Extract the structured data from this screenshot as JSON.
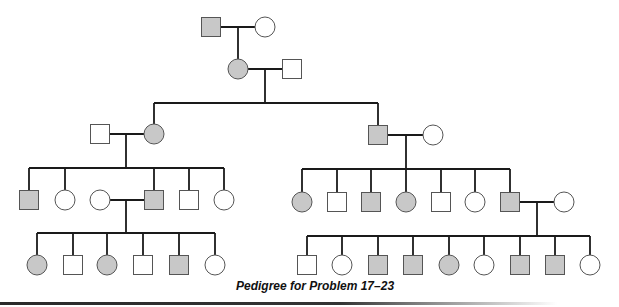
{
  "caption": "Pedigree for Problem 17–23",
  "colors": {
    "line": "#1a1a1a",
    "affected_fill": "#c8c8c8",
    "unaffected_fill": "#ffffff",
    "outline": "#555555"
  },
  "legend": {
    "square": "male",
    "circle": "female",
    "shaded": "affected",
    "unshaded": "unaffected"
  },
  "generations": [
    {
      "label": "I",
      "individuals": [
        {
          "id": "I-1",
          "sex": "male",
          "affected": true,
          "x": 211,
          "y": 27
        },
        {
          "id": "I-2",
          "sex": "female",
          "affected": false,
          "x": 265,
          "y": 27
        }
      ]
    },
    {
      "label": "II (top)",
      "individuals": [
        {
          "id": "II-1",
          "sex": "female",
          "affected": true,
          "x": 238,
          "y": 69,
          "parents": [
            "I-1",
            "I-2"
          ]
        },
        {
          "id": "II-2",
          "sex": "male",
          "affected": false,
          "x": 292,
          "y": 69
        }
      ]
    },
    {
      "label": "III (children of II-1 x II-2)",
      "individuals": [
        {
          "id": "III-1",
          "sex": "male",
          "affected": false,
          "x": 100,
          "y": 134
        },
        {
          "id": "III-2",
          "sex": "female",
          "affected": true,
          "x": 154,
          "y": 134,
          "parents": [
            "II-1",
            "II-2"
          ]
        },
        {
          "id": "III-3",
          "sex": "male",
          "affected": true,
          "x": 378,
          "y": 135,
          "parents": [
            "II-1",
            "II-2"
          ]
        },
        {
          "id": "III-4",
          "sex": "female",
          "affected": false,
          "x": 433,
          "y": 135
        }
      ]
    },
    {
      "label": "IV",
      "individuals": [
        {
          "id": "IV-1",
          "sex": "male",
          "affected": true,
          "x": 29,
          "y": 200,
          "parents": [
            "III-1",
            "III-2"
          ]
        },
        {
          "id": "IV-2",
          "sex": "female",
          "affected": false,
          "x": 65,
          "y": 200,
          "parents": [
            "III-1",
            "III-2"
          ]
        },
        {
          "id": "IV-3",
          "sex": "female",
          "affected": false,
          "x": 100,
          "y": 200
        },
        {
          "id": "IV-4",
          "sex": "male",
          "affected": true,
          "x": 154,
          "y": 200,
          "parents": [
            "III-1",
            "III-2"
          ]
        },
        {
          "id": "IV-5",
          "sex": "male",
          "affected": false,
          "x": 189,
          "y": 200,
          "parents": [
            "III-1",
            "III-2"
          ]
        },
        {
          "id": "IV-6",
          "sex": "female",
          "affected": false,
          "x": 224,
          "y": 200,
          "parents": [
            "III-1",
            "III-2"
          ]
        },
        {
          "id": "IV-7",
          "sex": "female",
          "affected": true,
          "x": 302,
          "y": 202,
          "parents": [
            "III-3",
            "III-4"
          ]
        },
        {
          "id": "IV-8",
          "sex": "male",
          "affected": false,
          "x": 337,
          "y": 202,
          "parents": [
            "III-3",
            "III-4"
          ]
        },
        {
          "id": "IV-9",
          "sex": "male",
          "affected": true,
          "x": 371,
          "y": 202,
          "parents": [
            "III-3",
            "III-4"
          ]
        },
        {
          "id": "IV-10",
          "sex": "female",
          "affected": true,
          "x": 406,
          "y": 202,
          "parents": [
            "III-3",
            "III-4"
          ]
        },
        {
          "id": "IV-11",
          "sex": "male",
          "affected": false,
          "x": 441,
          "y": 202,
          "parents": [
            "III-3",
            "III-4"
          ]
        },
        {
          "id": "IV-12",
          "sex": "female",
          "affected": false,
          "x": 475,
          "y": 202,
          "parents": [
            "III-3",
            "III-4"
          ]
        },
        {
          "id": "IV-13",
          "sex": "male",
          "affected": true,
          "x": 510,
          "y": 202,
          "parents": [
            "III-3",
            "III-4"
          ]
        },
        {
          "id": "IV-14",
          "sex": "female",
          "affected": false,
          "x": 564,
          "y": 202
        }
      ]
    },
    {
      "label": "V",
      "individuals": [
        {
          "id": "V-1",
          "sex": "female",
          "affected": true,
          "x": 37,
          "y": 265,
          "parents": [
            "IV-3",
            "IV-4"
          ]
        },
        {
          "id": "V-2",
          "sex": "male",
          "affected": false,
          "x": 73,
          "y": 265,
          "parents": [
            "IV-3",
            "IV-4"
          ]
        },
        {
          "id": "V-3",
          "sex": "female",
          "affected": true,
          "x": 107,
          "y": 265,
          "parents": [
            "IV-3",
            "IV-4"
          ]
        },
        {
          "id": "V-4",
          "sex": "male",
          "affected": false,
          "x": 143,
          "y": 265,
          "parents": [
            "IV-3",
            "IV-4"
          ]
        },
        {
          "id": "V-5",
          "sex": "male",
          "affected": true,
          "x": 179,
          "y": 265,
          "parents": [
            "IV-3",
            "IV-4"
          ]
        },
        {
          "id": "V-6",
          "sex": "female",
          "affected": false,
          "x": 215,
          "y": 265,
          "parents": [
            "IV-3",
            "IV-4"
          ]
        },
        {
          "id": "V-7",
          "sex": "male",
          "affected": false,
          "x": 307,
          "y": 265,
          "parents": [
            "IV-13",
            "IV-14"
          ]
        },
        {
          "id": "V-8",
          "sex": "female",
          "affected": false,
          "x": 342,
          "y": 265,
          "parents": [
            "IV-13",
            "IV-14"
          ]
        },
        {
          "id": "V-9",
          "sex": "male",
          "affected": true,
          "x": 378,
          "y": 265,
          "parents": [
            "IV-13",
            "IV-14"
          ]
        },
        {
          "id": "V-10",
          "sex": "male",
          "affected": true,
          "x": 413,
          "y": 265,
          "parents": [
            "IV-13",
            "IV-14"
          ]
        },
        {
          "id": "V-11",
          "sex": "female",
          "affected": true,
          "x": 449,
          "y": 265,
          "parents": [
            "IV-13",
            "IV-14"
          ]
        },
        {
          "id": "V-12",
          "sex": "female",
          "affected": false,
          "x": 484,
          "y": 265,
          "parents": [
            "IV-13",
            "IV-14"
          ]
        },
        {
          "id": "V-13",
          "sex": "male",
          "affected": true,
          "x": 520,
          "y": 265,
          "parents": [
            "IV-13",
            "IV-14"
          ]
        },
        {
          "id": "V-14",
          "sex": "male",
          "affected": true,
          "x": 555,
          "y": 265,
          "parents": [
            "IV-13",
            "IV-14"
          ]
        },
        {
          "id": "V-15",
          "sex": "female",
          "affected": false,
          "x": 590,
          "y": 265,
          "parents": [
            "IV-13",
            "IV-14"
          ]
        }
      ]
    }
  ],
  "matings": [
    {
      "a": "I-1",
      "b": "I-2",
      "y": 27,
      "drop_x": 238,
      "bar_y": 0,
      "children": [
        "II-1"
      ]
    },
    {
      "a": "II-1",
      "b": "II-2",
      "y": 69,
      "drop_x": 265,
      "bar_y": 103,
      "children": [
        "III-2",
        "III-3"
      ]
    },
    {
      "a": "III-1",
      "b": "III-2",
      "y": 134,
      "drop_x": 126,
      "bar_y": 168,
      "children": [
        "IV-1",
        "IV-2",
        "IV-4",
        "IV-5",
        "IV-6"
      ]
    },
    {
      "a": "III-3",
      "b": "III-4",
      "y": 135,
      "drop_x": 406,
      "bar_y": 169,
      "children": [
        "IV-7",
        "IV-8",
        "IV-9",
        "IV-10",
        "IV-11",
        "IV-12",
        "IV-13"
      ]
    },
    {
      "a": "IV-3",
      "b": "IV-4",
      "y": 200,
      "drop_x": 126,
      "bar_y": 233,
      "children": [
        "V-1",
        "V-2",
        "V-3",
        "V-4",
        "V-5",
        "V-6"
      ]
    },
    {
      "a": "IV-13",
      "b": "IV-14",
      "y": 202,
      "drop_x": 537,
      "bar_y": 236,
      "children": [
        "V-7",
        "V-8",
        "V-9",
        "V-10",
        "V-11",
        "V-12",
        "V-13",
        "V-14",
        "V-15"
      ]
    }
  ]
}
